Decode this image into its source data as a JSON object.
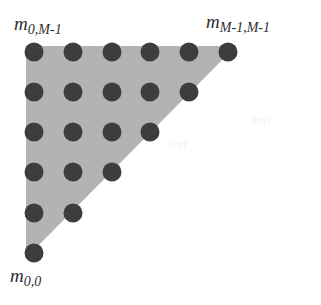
{
  "figure": {
    "type": "lattice-triangle-diagram",
    "canvas": {
      "width": 321,
      "height": 305,
      "background": "#ffffff"
    },
    "colors": {
      "triangle_fill": "#b3b3b3",
      "dot_fill": "#3d3d3d",
      "label_text": "#2e2e2e",
      "background": "#ffffff"
    },
    "labels": {
      "top_left": {
        "base": "m",
        "sub": "0,M-1"
      },
      "top_right": {
        "base": "m",
        "sub": "M-1,M-1"
      },
      "bottom_left": {
        "base": "m",
        "sub": "0,0"
      }
    },
    "geometry": {
      "origin_x": 34,
      "origin_y": 52,
      "dx": 38.8,
      "dy": 40.2,
      "dot_radius": 9.5,
      "rows": 6,
      "triangle_vertices": [
        [
          26,
          46
        ],
        [
          236,
          46
        ],
        [
          26,
          258
        ]
      ]
    },
    "lattice": {
      "description": "Right-triangular point lattice, row counts decreasing from top",
      "row_counts": [
        6,
        5,
        4,
        3,
        2,
        1
      ],
      "points": [
        [
          [
            34,
            52
          ],
          [
            73,
            52
          ],
          [
            112,
            52
          ],
          [
            150,
            52
          ],
          [
            189,
            52
          ],
          [
            228,
            52
          ]
        ],
        [
          [
            34,
            92
          ],
          [
            73,
            92
          ],
          [
            112,
            92
          ],
          [
            150,
            92
          ],
          [
            189,
            92
          ]
        ],
        [
          [
            34,
            132
          ],
          [
            73,
            132
          ],
          [
            112,
            132
          ],
          [
            150,
            132
          ]
        ],
        [
          [
            34,
            172
          ],
          [
            73,
            172
          ],
          [
            112,
            172
          ]
        ],
        [
          [
            34,
            213
          ],
          [
            73,
            213
          ]
        ],
        [
          [
            34,
            253
          ]
        ]
      ]
    },
    "artifacts": {
      "right": "text",
      "middle": "text"
    }
  }
}
